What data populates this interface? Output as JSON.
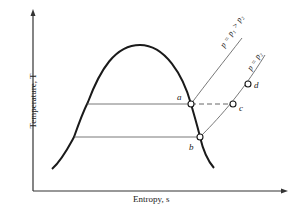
{
  "diagram": {
    "type": "T-s diagram",
    "axes": {
      "x_label": "Entropy, s",
      "y_label": "Temperature, T"
    },
    "isobars": [
      {
        "label": "p = p₁ > p₂",
        "id": "p1"
      },
      {
        "label": "p = p₂",
        "id": "p2"
      }
    ],
    "points": [
      {
        "label": "a"
      },
      {
        "label": "b"
      },
      {
        "label": "c"
      },
      {
        "label": "d"
      }
    ],
    "colors": {
      "line": "#1a1a1a",
      "thin_line": "#555555",
      "background": "#ffffff"
    }
  }
}
